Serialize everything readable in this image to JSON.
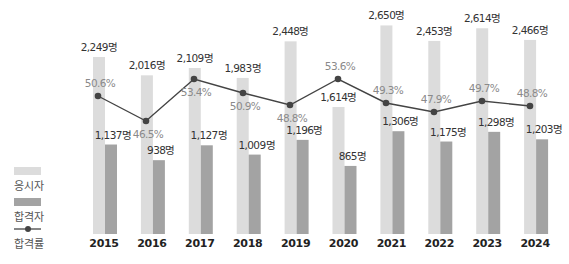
{
  "chart_data": {
    "type": "bar",
    "title": "",
    "xlabel": "",
    "ylabel": "",
    "categories": [
      "2015",
      "2016",
      "2017",
      "2018",
      "2019",
      "2020",
      "2021",
      "2022",
      "2023",
      "2024"
    ],
    "series": [
      {
        "name": "응시자",
        "kind": "bar",
        "color": "#dcdcdc",
        "values": [
          2249,
          2016,
          2109,
          1983,
          2448,
          1614,
          2650,
          2453,
          2614,
          2466
        ],
        "labels": [
          "2,249명",
          "2,016명",
          "2,109명",
          "1,983명",
          "2,448명",
          "1,614명",
          "2,650명",
          "2,453명",
          "2,614명",
          "2,466명"
        ]
      },
      {
        "name": "합격자",
        "kind": "bar",
        "color": "#a3a3a3",
        "values": [
          1137,
          938,
          1127,
          1009,
          1196,
          865,
          1306,
          1175,
          1298,
          1203
        ],
        "labels": [
          "1,137명",
          "938명",
          "1,127명",
          "1,009명",
          "1,196명",
          "865명",
          "1,306명",
          "1,175명",
          "1,298명",
          "1,203명"
        ]
      },
      {
        "name": "합격률",
        "kind": "line",
        "color": "#444444",
        "values": [
          50.6,
          46.5,
          53.4,
          50.9,
          48.8,
          53.6,
          49.3,
          47.9,
          49.7,
          48.8
        ],
        "labels": [
          "50.6%",
          "46.5%",
          "53.4%",
          "50.9%",
          "48.8%",
          "53.6%",
          "49.3%",
          "47.9%",
          "49.7%",
          "48.8%"
        ]
      }
    ],
    "legend": {
      "position": "left",
      "entries": [
        "응시자",
        "합격자",
        "합격률"
      ]
    },
    "grid": false
  },
  "legend": {
    "applicants": "응시자",
    "passers": "합격자",
    "pass_rate": "합격률"
  }
}
